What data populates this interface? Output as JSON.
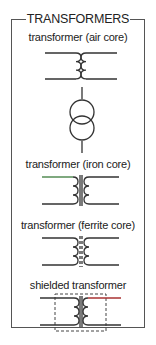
{
  "title": "TRANSFORMERS",
  "symbols": [
    {
      "label": "transformer (air core)"
    },
    {
      "label": "transformer (iron core)"
    },
    {
      "label": "transformer (ferrite core)"
    },
    {
      "label": "shielded transformer"
    }
  ],
  "colors": {
    "line": "#333333",
    "accent_red": "#a83232",
    "accent_green": "#3a7a3a",
    "frame": "#555555"
  }
}
